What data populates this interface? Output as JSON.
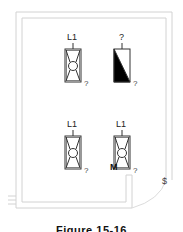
{
  "figure": {
    "caption": "Figure 15-16"
  },
  "fixtures": [
    {
      "id": "top-left",
      "circuit_label": "L1",
      "corner_label": "?",
      "type": "fluorescent-x"
    },
    {
      "id": "top-right",
      "circuit_label": "?",
      "corner_label": "?",
      "type": "emergency-shaded"
    },
    {
      "id": "bottom-left",
      "circuit_label": "L1",
      "corner_label": "?",
      "type": "fluorescent-x"
    },
    {
      "id": "bottom-right",
      "circuit_label": "L1",
      "corner_label": "?",
      "type": "fluorescent-x",
      "marker": "M"
    }
  ],
  "switch": {
    "symbol": "$"
  },
  "colors": {
    "wall": "#cfcfcf",
    "fixture_stroke": "#333333",
    "fill_dark": "#000000"
  }
}
